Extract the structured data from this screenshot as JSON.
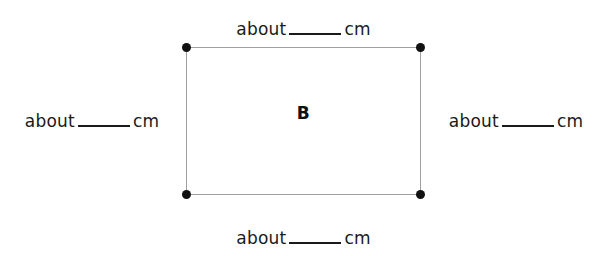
{
  "worksheet": {
    "background_color": "#ffffff",
    "figure": {
      "label": "B",
      "shape": "rectangle",
      "outline_color": "#a0a0a0",
      "vertex_color": "#111111",
      "vertex_count": 4
    },
    "measurements": {
      "top": {
        "prefix": "about",
        "value": "",
        "unit": "cm"
      },
      "right": {
        "prefix": "about",
        "value": "",
        "unit": "cm"
      },
      "bottom": {
        "prefix": "about",
        "value": "",
        "unit": "cm"
      },
      "left": {
        "prefix": "about",
        "value": "",
        "unit": "cm"
      }
    }
  }
}
